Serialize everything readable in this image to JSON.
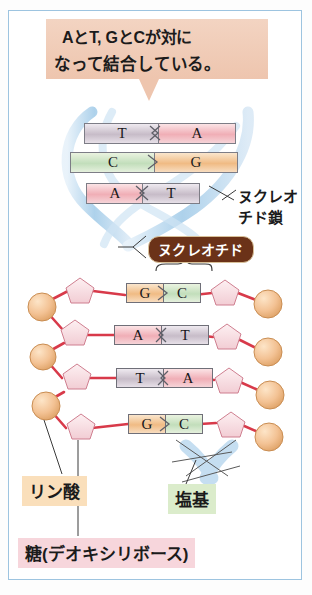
{
  "figure": {
    "title_callout": {
      "line1": "AとT, GとCが対に",
      "line2": "なって結合している。"
    },
    "helix": {
      "chain_label_line1": "ヌクレオ",
      "chain_label_line2": "チド鎖",
      "pairs": [
        {
          "left": "T",
          "right": "A",
          "left_color": "#c7bcc8",
          "right_color": "#f0aeb6"
        },
        {
          "left": "C",
          "right": "G",
          "left_color": "#c2debb",
          "right_color": "#f0bb84"
        },
        {
          "left": "A",
          "right": "T",
          "left_color": "#f0aeb6",
          "right_color": "#c7bcc8"
        }
      ]
    },
    "nucleotide_badge": "ヌクレオチド",
    "ladder": {
      "rows": [
        {
          "left": "G",
          "right": "C",
          "left_color": "#f0bb84",
          "right_color": "#c2debb"
        },
        {
          "left": "A",
          "right": "T",
          "left_color": "#f0aeb6",
          "right_color": "#c7bcc8"
        },
        {
          "left": "T",
          "right": "A",
          "left_color": "#c7bcc8",
          "right_color": "#f0aeb6"
        },
        {
          "left": "G",
          "right": "C",
          "left_color": "#f0bb84",
          "right_color": "#c2debb"
        }
      ]
    },
    "legend": {
      "phosphate": "リン酸",
      "base": "塩基",
      "sugar": "糖(デオキシリボース)"
    },
    "colors": {
      "frame": "#9dc4e0",
      "callout_bg": "#eec5ae",
      "badge_bg": "#6b3218",
      "backbone_line": "#d83a4a",
      "phosphate_circle": "#f2c191",
      "sugar_pentagon": "#f6dade",
      "ribbon_blue": "#bcd9ef"
    }
  }
}
